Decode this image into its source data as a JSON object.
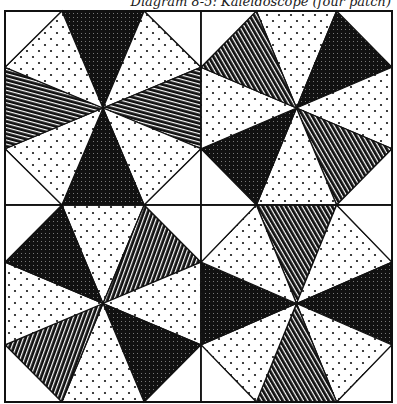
{
  "caption": "Diagram 8-5: Kaleidoscope (four patch)",
  "colors": {
    "ink": "#111111",
    "paper": "#ffffff"
  },
  "layout": {
    "left": 5,
    "top": 11,
    "right": 392,
    "bottom": 402,
    "mid_x": 201,
    "mid_y": 205
  },
  "fabrics": [
    "crosshatch",
    "dots",
    "lines"
  ],
  "blocks": [
    {
      "name": "top-left",
      "wedges": [
        "crosshatch",
        "dots",
        "lines",
        "dots",
        "crosshatch",
        "dots",
        "lines",
        "dots"
      ]
    },
    {
      "name": "top-right",
      "wedges": [
        "dots",
        "crosshatch",
        "dots",
        "lines",
        "dots",
        "crosshatch",
        "dots",
        "lines"
      ]
    },
    {
      "name": "bottom-left",
      "wedges": [
        "dots",
        "lines",
        "dots",
        "crosshatch",
        "dots",
        "lines",
        "dots",
        "crosshatch"
      ]
    },
    {
      "name": "bottom-right",
      "wedges": [
        "lines",
        "dots",
        "crosshatch",
        "dots",
        "lines",
        "dots",
        "crosshatch",
        "dots"
      ]
    }
  ]
}
